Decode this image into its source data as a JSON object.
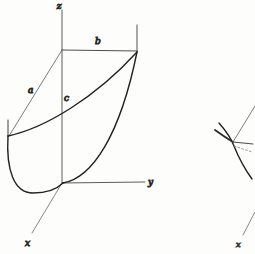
{
  "figure": {
    "background_color": "#fdfdfc",
    "ink_color": "#2b2b2b",
    "faint_ink_color": "#6e6e6e",
    "caption": "",
    "primary_diagram": {
      "name": "elliptic-paraboloid-octant-sketch",
      "axes": [
        {
          "id": "z",
          "label": "z",
          "label_x": 62,
          "label_y": 8,
          "orientation": "vertical-up"
        },
        {
          "id": "y",
          "label": "y",
          "label_x": 148,
          "label_y": 184,
          "orientation": "horizontal-right"
        },
        {
          "id": "x",
          "label": "x",
          "label_x": 27,
          "label_y": 245,
          "orientation": "oblique-down-left"
        }
      ],
      "segment_labels": [
        {
          "id": "a",
          "label": "a",
          "label_x": 30,
          "label_y": 92,
          "describes": "slant-edge-from-z-top-to-x-axis-point"
        },
        {
          "id": "b",
          "label": "b",
          "label_x": 97,
          "label_y": 43,
          "describes": "horizontal-top-edge-along-y"
        },
        {
          "id": "c",
          "label": "c",
          "label_x": 66,
          "label_y": 100,
          "describes": "vertical-height-on-z-axis"
        }
      ],
      "origin": {
        "x": 62,
        "y": 183
      },
      "z_top": {
        "x": 62,
        "y": 50
      },
      "corner_right": {
        "x": 137,
        "y": 52
      },
      "corner_left": {
        "x": 8,
        "y": 135
      }
    },
    "secondary_diagram": {
      "name": "partial-tangent-sketch-right-edge",
      "axes": [
        {
          "id": "x2",
          "label": "x",
          "label_x": 239,
          "label_y": 246,
          "orientation": "oblique-down-left"
        }
      ],
      "node": {
        "x": 233,
        "y": 142
      },
      "note": "cropped figure at right margin showing a curve with tangent and dashed construction lines"
    }
  }
}
